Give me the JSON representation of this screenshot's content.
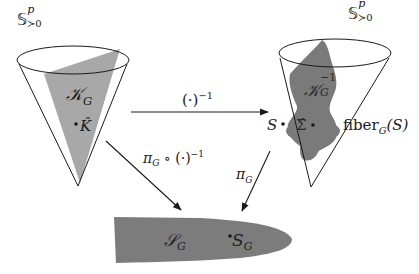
{
  "diagram": {
    "colors": {
      "left_region": "#a8a8a8",
      "right_region": "#7a7a7a",
      "bottom_region": "#7c7c7c",
      "stroke": "#1a1a1a",
      "background": "#ffffff"
    },
    "left_cone": {
      "space_label": "𝕊",
      "space_sup": "p",
      "space_sub": "≻0",
      "region_label": "𝒦",
      "region_sub": "G",
      "point_label": "K̂"
    },
    "right_cone": {
      "space_label": "𝕊",
      "space_sup": "p",
      "space_sub": "≻0",
      "region_label": "𝒦",
      "region_sub": "G",
      "region_sup": "−1",
      "point_S": "S",
      "point_sigma": "Σ̂",
      "fiber_label": "fiber",
      "fiber_sub": "G",
      "fiber_arg": "(S)"
    },
    "arrows": [
      {
        "name": "inverse",
        "label": "(·)",
        "label_sup": "−1"
      },
      {
        "name": "projection-of-inverse",
        "label": "π",
        "label_sub": "G",
        "label_rest": " ∘ (·)",
        "label_sup": "−1"
      },
      {
        "name": "projection",
        "label": "π",
        "label_sub": "G"
      }
    ],
    "bottom_region": {
      "set_label": "𝒮",
      "set_sub": "G",
      "point_label": "S",
      "point_sub": "G"
    }
  }
}
